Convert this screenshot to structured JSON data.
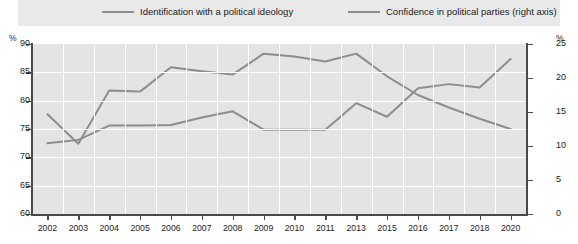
{
  "legend": {
    "series1_label": "Identification with a political ideology",
    "series2_label": "Confidence in political parties (right axis)"
  },
  "axes": {
    "left_unit": "%",
    "right_unit": "%",
    "left_ticks": [
      "90",
      "85",
      "80",
      "75",
      "70",
      "65",
      "60"
    ],
    "right_ticks": [
      "25",
      "20",
      "15",
      "10",
      "5",
      "0"
    ]
  },
  "colors": {
    "line": "#8d8d8d",
    "plot_background": "#e4e4e4",
    "legend_background": "#e9e9e9",
    "gridline": "#ffffff",
    "axis": "#4a4a4a",
    "text": "#1b1b1b"
  },
  "chart_data": {
    "type": "line",
    "title": "",
    "xlabel": "",
    "ylabel": "%",
    "grid": true,
    "legend_position": "top",
    "x": [
      2002,
      2003,
      2004,
      2005,
      2006,
      2007,
      2008,
      2009,
      2010,
      2011,
      2013,
      2015,
      2016,
      2017,
      2018,
      2020
    ],
    "tick_labels": [
      "2002",
      "2003",
      "2004",
      "2005",
      "2006",
      "2007",
      "2008",
      "2009",
      "2010",
      "2011",
      "2013",
      "2015",
      "2016",
      "2017",
      "2018",
      "2020"
    ],
    "series": [
      {
        "name": "Identification with a political ideology",
        "axis": "left",
        "ylabel": "%",
        "ylim": [
          60,
          90
        ],
        "values": [
          77.6,
          72.4,
          81.8,
          81.6,
          85.9,
          85.2,
          84.6,
          88.3,
          87.8,
          86.9,
          88.3,
          84.3,
          81.0,
          78.8,
          76.8,
          75.0
        ]
      },
      {
        "name": "Confidence in political parties (right axis)",
        "axis": "right",
        "ylabel": "%",
        "ylim": [
          0,
          25
        ],
        "values": [
          10.4,
          10.9,
          13.0,
          13.0,
          13.1,
          14.2,
          15.1,
          12.4,
          12.4,
          12.4,
          16.3,
          14.3,
          18.5,
          19.1,
          18.6,
          22.8
        ]
      }
    ]
  }
}
